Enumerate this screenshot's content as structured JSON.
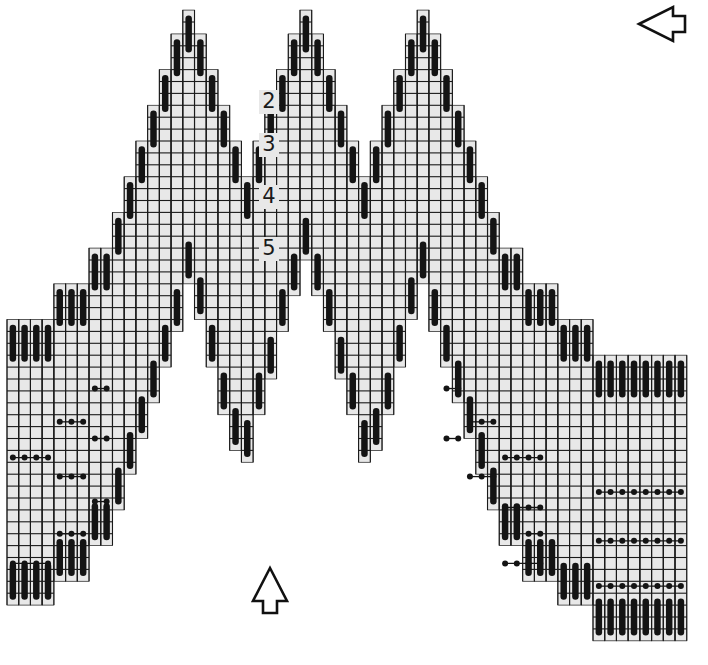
{
  "diagram": {
    "type": "needlepoint-stitch-chart",
    "row_labels": [
      {
        "text": "2",
        "x": 269,
        "y": 102
      },
      {
        "text": "3",
        "x": 269,
        "y": 145
      },
      {
        "text": "4",
        "x": 269,
        "y": 197
      },
      {
        "text": "5",
        "x": 269,
        "y": 249
      }
    ],
    "arrows": [
      {
        "name": "direction-arrow-left",
        "direction": "left",
        "x": 660,
        "y": 24
      },
      {
        "name": "direction-arrow-up",
        "direction": "up",
        "x": 270,
        "y": 590
      }
    ],
    "grid": {
      "origin_x": 7,
      "origin_y": 22,
      "cell_w": 11.72,
      "cell_h": 11.9,
      "columns": 58
    },
    "colors": {
      "cell_fill": "#e8e8e8",
      "line": "#1a1a1a",
      "stitch": "#141414",
      "background": "#ffffff"
    }
  }
}
